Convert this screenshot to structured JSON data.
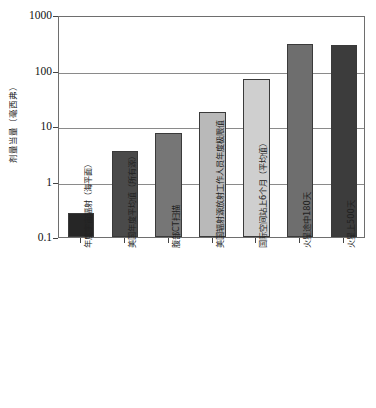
{
  "chart_data": {
    "type": "bar",
    "title": "",
    "subtitle": "",
    "xlabel": "",
    "ylabel": "剂量当量（毫西弗）",
    "yscale": "log",
    "ylim": [
      0.1,
      1000
    ],
    "ytick_labels": [
      "1000",
      "100",
      "10",
      "1",
      "0.1"
    ],
    "ytick_values": [
      1000,
      100,
      10,
      1,
      0.1
    ],
    "grid": true,
    "legend": "none",
    "categories": [
      "年度宇宙辐射（海平面）",
      "美国年度平均值（所有源）",
      "腹部CT扫描",
      "美国辐射源放射工作人员年度极限值",
      "国际空间站上6个月（平均值）",
      "火星途中180天",
      "火星上500天"
    ],
    "values": [
      0.27,
      3.6,
      7.5,
      18,
      70,
      300,
      290
    ],
    "bar_colors": [
      "#262626",
      "#4a4a4a",
      "#767676",
      "#b9b9b9",
      "#cfcfcf",
      "#6e6e6e",
      "#3c3c3c"
    ],
    "bar_edge_color": "#3a3a3a",
    "axis_color": "#6e6e6e",
    "grid_color": "#8a8a8a",
    "background": "#ffffff"
  }
}
